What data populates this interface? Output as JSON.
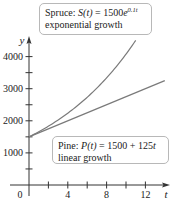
{
  "chart_data": {
    "type": "line",
    "title": "",
    "xlabel": "t",
    "ylabel": "y",
    "xlim": [
      0,
      14
    ],
    "ylim": [
      0,
      4500
    ],
    "x_ticks": [
      2,
      4,
      6,
      8,
      10,
      12
    ],
    "x_tick_labels": [
      "0",
      "4",
      "8",
      "12"
    ],
    "y_ticks": [
      500,
      1000,
      1500,
      2000,
      2500,
      3000,
      3500,
      4000
    ],
    "y_tick_labels": [
      "1000",
      "2000",
      "3000",
      "4000"
    ],
    "grid": false,
    "series": [
      {
        "name": "Spruce",
        "formula": "S(t) = 1500e^{0.1t}",
        "description": "exponential growth",
        "x": [
          0,
          2,
          4,
          6,
          8,
          10,
          11
        ],
        "values": [
          1500,
          1832,
          2238,
          2733,
          3338,
          4077,
          4506
        ]
      },
      {
        "name": "Pine",
        "formula": "P(t) = 1500 + 125t",
        "description": "linear growth",
        "x": [
          0,
          2,
          4,
          6,
          8,
          10,
          12,
          14
        ],
        "values": [
          1500,
          1750,
          2000,
          2250,
          2500,
          2750,
          3000,
          3250
        ]
      }
    ],
    "annotations": [
      {
        "series": "Spruce",
        "text": "Spruce: S(t) = 1500e^{0.1t}",
        "subtext": "exponential growth",
        "position": "top"
      },
      {
        "series": "Pine",
        "text": "Pine: P(t) = 1500 + 125t",
        "subtext": "linear growth",
        "position": "lower-right"
      }
    ]
  },
  "labels": {
    "spruce": {
      "name": "Spruce: ",
      "func": "S(t)",
      "eq": " = 1500",
      "base": "e",
      "exp": "0.1t",
      "desc": "exponential growth"
    },
    "pine": {
      "name": "Pine: ",
      "func": "P(t)",
      "eq": " = 1500 + 125",
      "var": "t",
      "desc": "linear growth"
    }
  },
  "axes": {
    "x_label": "t",
    "y_label": "y",
    "origin": "0",
    "x_ticks": [
      {
        "t": 2,
        "label": ""
      },
      {
        "t": 4,
        "label": "4"
      },
      {
        "t": 6,
        "label": ""
      },
      {
        "t": 8,
        "label": "8"
      },
      {
        "t": 10,
        "label": ""
      },
      {
        "t": 12,
        "label": "12"
      }
    ],
    "y_ticks": [
      {
        "v": 500,
        "label": ""
      },
      {
        "v": 1000,
        "label": "1000"
      },
      {
        "v": 1500,
        "label": ""
      },
      {
        "v": 2000,
        "label": "2000"
      },
      {
        "v": 2500,
        "label": ""
      },
      {
        "v": 3000,
        "label": "3000"
      },
      {
        "v": 3500,
        "label": ""
      },
      {
        "v": 4000,
        "label": "4000"
      }
    ]
  },
  "style": {
    "axis_color": "#333333",
    "curve_color": "#7a7a7a",
    "text_color": "#222222"
  }
}
